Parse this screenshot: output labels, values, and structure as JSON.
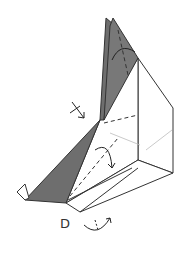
{
  "diagram": {
    "type": "origami-step",
    "labels": {
      "point_d": "D"
    },
    "colors": {
      "paper_colored": "#6e6e6e",
      "line": "#333333",
      "guide": "#999999",
      "background": "#ffffff"
    },
    "symbols": [
      "valley-fold-arrow-top",
      "valley-fold-arrow-middle",
      "swivel-arrow-bottom",
      "push-arrow-left"
    ]
  }
}
